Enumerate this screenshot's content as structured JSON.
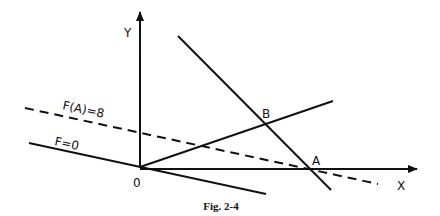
{
  "figure": {
    "caption": "Fig. 2-4",
    "line_color": "#111111",
    "background": "#ffffff"
  },
  "axes": {
    "x_label": "X",
    "y_label": "Y",
    "origin_label": "0"
  },
  "points": {
    "A": "A",
    "B": "B"
  },
  "lines": {
    "objective_zero_label": "F=0",
    "objective_A_label": "F(A)=8"
  }
}
